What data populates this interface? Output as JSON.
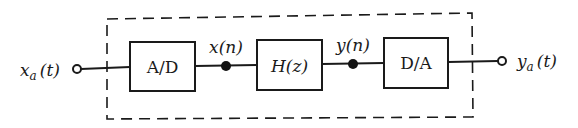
{
  "diagram": {
    "type": "block-diagram",
    "input": {
      "symbol": "x",
      "subscript": "a",
      "arg": "(t)"
    },
    "output": {
      "symbol": "y",
      "subscript": "a",
      "arg": "(t)"
    },
    "blocks": [
      {
        "id": "ad",
        "label": "A/D"
      },
      {
        "id": "hz",
        "label_main": "H",
        "label_arg": "(z)"
      },
      {
        "id": "da",
        "label": "D/A"
      }
    ],
    "signals": [
      {
        "symbol": "x",
        "arg": "(n)"
      },
      {
        "symbol": "y",
        "arg": "(n)"
      }
    ],
    "enclosure": "dashed",
    "colors": {
      "stroke": "#1a1a1a",
      "background": "#ffffff"
    }
  }
}
